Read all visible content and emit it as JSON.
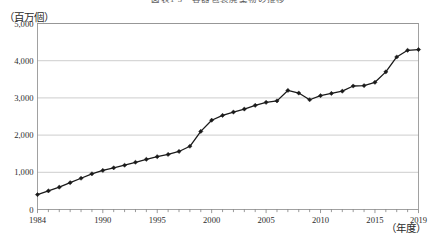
{
  "figure": {
    "title": "図表1-3　容器包装廃棄物の推移",
    "unit_label": "（百万個）",
    "x_unit_label": "（年度）"
  },
  "chart_data": {
    "type": "line",
    "title": "図表1-3　容器包装廃棄物の推移",
    "xlabel": "（年度）",
    "ylabel": "（百万個）",
    "ylim": [
      0,
      5000
    ],
    "xlim": [
      1984,
      2019
    ],
    "grid": true,
    "legend": null,
    "marker": "diamond",
    "line_color": "#1a1a1a",
    "ytick_labels": [
      "0",
      "1,000",
      "2,000",
      "3,000",
      "4,000",
      "5,000"
    ],
    "ytick_values": [
      0,
      1000,
      2000,
      3000,
      4000,
      5000
    ],
    "xtick_labels": [
      "1984",
      "1990",
      "1995",
      "2000",
      "2005",
      "2010",
      "2015",
      "2019"
    ],
    "xtick_values": [
      1984,
      1990,
      1995,
      2000,
      2005,
      2010,
      2015,
      2019
    ],
    "x": [
      1984,
      1985,
      1986,
      1987,
      1988,
      1989,
      1990,
      1991,
      1992,
      1993,
      1994,
      1995,
      1996,
      1997,
      1998,
      1999,
      2000,
      2001,
      2002,
      2003,
      2004,
      2005,
      2006,
      2007,
      2008,
      2009,
      2010,
      2011,
      2012,
      2013,
      2014,
      2015,
      2016,
      2017,
      2018,
      2019
    ],
    "values": [
      400,
      500,
      600,
      720,
      840,
      960,
      1050,
      1120,
      1190,
      1270,
      1350,
      1420,
      1480,
      1560,
      1700,
      2100,
      2400,
      2530,
      2620,
      2700,
      2800,
      2880,
      2920,
      3200,
      3130,
      2950,
      3060,
      3120,
      3180,
      3320,
      3330,
      3420,
      3700,
      4100,
      4280,
      4300
    ],
    "series": [
      {
        "name": "容器包装廃棄物",
        "values": [
          400,
          500,
          600,
          720,
          840,
          960,
          1050,
          1120,
          1190,
          1270,
          1350,
          1420,
          1480,
          1560,
          1700,
          2100,
          2400,
          2530,
          2620,
          2700,
          2800,
          2880,
          2920,
          3200,
          3130,
          2950,
          3060,
          3120,
          3180,
          3320,
          3330,
          3420,
          3700,
          4100,
          4280,
          4300
        ]
      }
    ]
  }
}
